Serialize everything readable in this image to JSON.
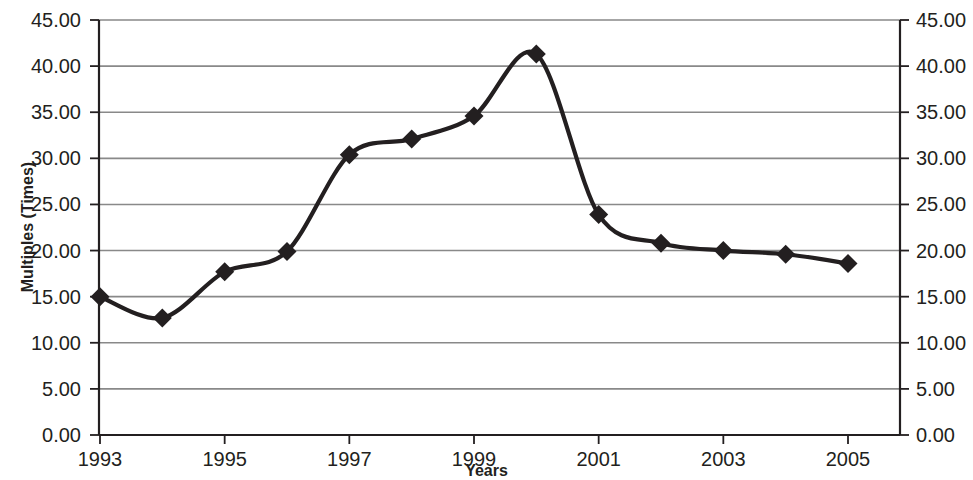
{
  "chart_data": {
    "type": "line",
    "title": "",
    "xlabel": "Years",
    "ylabel": "Multiples (Times)",
    "x": [
      1993,
      1994,
      1995,
      1996,
      1997,
      1998,
      1999,
      2000,
      2001,
      2002,
      2003,
      2004,
      2005
    ],
    "values": [
      15.0,
      12.7,
      17.7,
      19.9,
      30.4,
      32.1,
      34.6,
      41.3,
      23.9,
      20.8,
      20.0,
      19.6,
      18.6
    ],
    "series": [
      {
        "name": "Multiples",
        "values": [
          15.0,
          12.7,
          17.7,
          19.9,
          30.4,
          32.1,
          34.6,
          41.3,
          23.9,
          20.8,
          20.0,
          19.6,
          18.6
        ]
      }
    ],
    "ylim": [
      0,
      45
    ],
    "xlim": [
      1993,
      2005
    ],
    "grid": "horizontal",
    "legend": "none",
    "marker": "diamond",
    "line_color": "#231f20",
    "grid_color": "#898989",
    "axis_color": "#231f20",
    "y_ticks_left": [
      "0.00",
      "5.00",
      "10.00",
      "15.00",
      "20.00",
      "25.00",
      "30.00",
      "35.00",
      "40.00",
      "45.00"
    ],
    "y_ticks_right": [
      "0.00",
      "5.00",
      "10.00",
      "15.00",
      "20.00",
      "25.00",
      "30.00",
      "35.00",
      "40.00",
      "45.00"
    ],
    "y_tick_values": [
      0,
      5,
      10,
      15,
      20,
      25,
      30,
      35,
      40,
      45
    ],
    "x_ticks": [
      "1993",
      "1995",
      "1997",
      "1999",
      "2001",
      "2003",
      "2005"
    ],
    "x_tick_values": [
      1993,
      1995,
      1997,
      1999,
      2001,
      2003,
      2005
    ]
  }
}
